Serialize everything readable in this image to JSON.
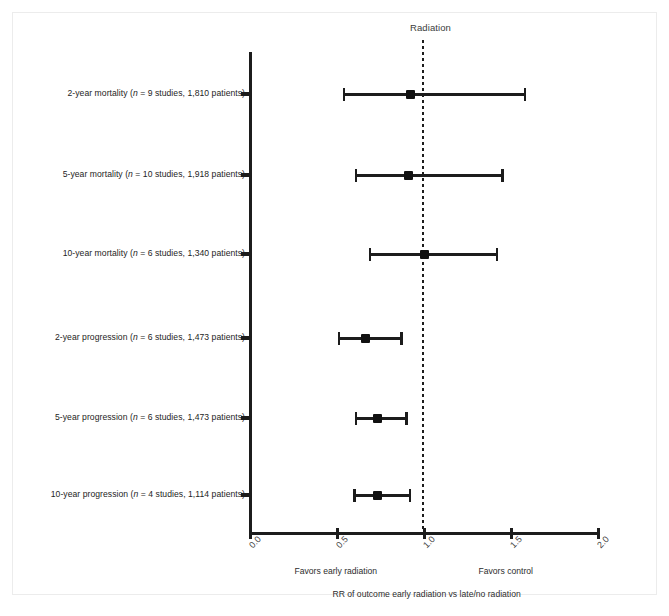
{
  "chart_data": {
    "type": "scatter",
    "subtype": "forest-plot",
    "title": "Radiation",
    "xlabel": "RR of outcome early radiation vs late/no radiation",
    "ylabel": "",
    "xlim": [
      0.0,
      2.0
    ],
    "xticks": [
      "0.0",
      "0.5",
      "1.0",
      "1.5",
      "2.0"
    ],
    "xtick_values": [
      0.0,
      0.5,
      1.0,
      1.5,
      2.0
    ],
    "grid": false,
    "legend": "none",
    "reference_line": 1.0,
    "reference_line_style": "dotted",
    "left_annotation": "Favors early radiation",
    "right_annotation": "Favors control",
    "categories": [
      "2-year mortality (n = 9 studies, 1,810 patients)",
      "5-year mortality (n = 10 studies, 1,918 patients)",
      "10-year mortality (n = 6 studies, 1,340 patients)",
      "2-year progression (n = 6 studies, 1,473 patients)",
      "5-year progression (n = 6 studies, 1,473 patients)",
      "10-year progression (n = 4 studies, 1,114 patients)"
    ],
    "rows": [
      {
        "outcome": "2-year mortality",
        "n_studies": 9,
        "n_patients": "1,810",
        "label_prefix": "2-year mortality (",
        "label_italic": "n",
        "label_suffix": " = 9 studies, 1,810 patients)",
        "estimate": 0.92,
        "ci_low": 0.53,
        "ci_high": 1.57
      },
      {
        "outcome": "5-year mortality",
        "n_studies": 10,
        "n_patients": "1,918",
        "label_prefix": "5-year mortality (",
        "label_italic": "n",
        "label_suffix": " = 10 studies, 1,918 patients)",
        "estimate": 0.91,
        "ci_low": 0.6,
        "ci_high": 1.44
      },
      {
        "outcome": "10-year mortality",
        "n_studies": 6,
        "n_patients": "1,340",
        "label_prefix": "10-year mortality (",
        "label_italic": "n",
        "label_suffix": " = 6 studies, 1,340 patients)",
        "estimate": 1.0,
        "ci_low": 0.68,
        "ci_high": 1.41
      },
      {
        "outcome": "2-year progression",
        "n_studies": 6,
        "n_patients": "1,473",
        "label_prefix": "2-year progression (",
        "label_italic": "n",
        "label_suffix": " = 6 studies, 1,473 patients)",
        "estimate": 0.66,
        "ci_low": 0.5,
        "ci_high": 0.86
      },
      {
        "outcome": "5-year progression",
        "n_studies": 6,
        "n_patients": "1,473",
        "label_prefix": "5-year progression (",
        "label_italic": "n",
        "label_suffix": " = 6 studies, 1,473 patients)",
        "estimate": 0.73,
        "ci_low": 0.6,
        "ci_high": 0.89
      },
      {
        "outcome": "10-year progression",
        "n_studies": 4,
        "n_patients": "1,114",
        "label_prefix": "10-year progression (",
        "label_italic": "n",
        "label_suffix": " = 4 studies, 1,114 patients)",
        "estimate": 0.73,
        "ci_low": 0.59,
        "ci_high": 0.91
      }
    ],
    "colors": {
      "marker": "#111111",
      "line": "#1c1c1c",
      "text": "#242424",
      "frame": "#ececec"
    }
  }
}
